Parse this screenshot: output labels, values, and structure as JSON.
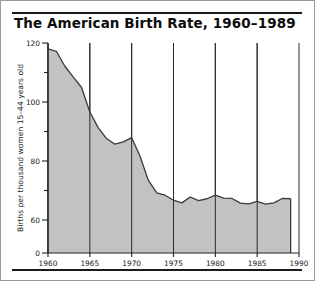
{
  "figure": {
    "title": "The American Birth Rate, 1960–1989",
    "border_color": "#9a9a9a",
    "rule_color": "#1a1a1a"
  },
  "chart_data": {
    "type": "area",
    "title": "The American Birth Rate, 1960–1989",
    "xlabel": "",
    "ylabel": "Births per thousand women 15–44 years old",
    "fill_color": "#c2c2c2",
    "line_color": "#3a3a3a",
    "grid": "vertical gridlines at major x ticks",
    "legend": "none",
    "xlim": [
      1960,
      1990
    ],
    "ylim": [
      0,
      120
    ],
    "y_axis_note": "broken axis: segment 0–60 compressed",
    "xticks": [
      1960,
      1965,
      1970,
      1975,
      1980,
      1985,
      1990
    ],
    "xticklabels": [
      "1960",
      "1965",
      "1970",
      "1975",
      "1980",
      "1985",
      "1990"
    ],
    "yticks": [
      0,
      60,
      70,
      80,
      90,
      100,
      110,
      120
    ],
    "yticklabels": [
      "0",
      "60",
      "",
      "80",
      "",
      "100",
      "",
      "120"
    ],
    "x": [
      1960,
      1961,
      1962,
      1963,
      1964,
      1965,
      1966,
      1967,
      1968,
      1969,
      1970,
      1971,
      1972,
      1973,
      1974,
      1975,
      1976,
      1977,
      1978,
      1979,
      1980,
      1981,
      1982,
      1983,
      1984,
      1985,
      1986,
      1987,
      1988,
      1989
    ],
    "values": [
      118.0,
      117.2,
      112.2,
      108.5,
      105.0,
      96.6,
      91.3,
      87.6,
      85.7,
      86.5,
      87.9,
      81.6,
      73.4,
      69.2,
      68.4,
      66.7,
      65.8,
      67.8,
      66.6,
      67.2,
      68.4,
      67.4,
      67.3,
      65.7,
      65.5,
      66.3,
      65.4,
      65.8,
      67.3,
      67.2
    ],
    "series_name": "Births per thousand women 15–44 years old"
  }
}
